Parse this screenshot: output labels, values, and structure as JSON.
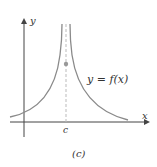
{
  "figure": {
    "caption": "(c)",
    "function_label": "y = f(x)",
    "x_axis_label": "x",
    "y_axis_label": "y",
    "asymptote_label": "c"
  },
  "colors": {
    "curve": "#8a8a8a",
    "axis": "#444444",
    "dot": "#999999",
    "dashed": "#bbbbbb"
  }
}
